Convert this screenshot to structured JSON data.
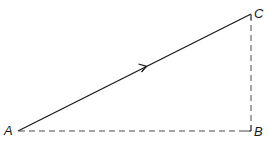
{
  "diagram": {
    "type": "vector-triangle",
    "points": {
      "A": {
        "label": "A",
        "x": 18,
        "y": 131
      },
      "B": {
        "label": "B",
        "x": 251,
        "y": 131
      },
      "C": {
        "label": "C",
        "x": 251,
        "y": 14
      }
    },
    "edges": [
      {
        "from": "A",
        "to": "C",
        "style": "solid",
        "arrow": "mid",
        "direction": "A-to-C"
      },
      {
        "from": "A",
        "to": "B",
        "style": "dashed"
      },
      {
        "from": "B",
        "to": "C",
        "style": "dashed"
      }
    ],
    "right_angle_at": "B",
    "colors": {
      "line": "#1a1a1a",
      "dashed": "#4a4a4a",
      "background": "#ffffff"
    }
  }
}
